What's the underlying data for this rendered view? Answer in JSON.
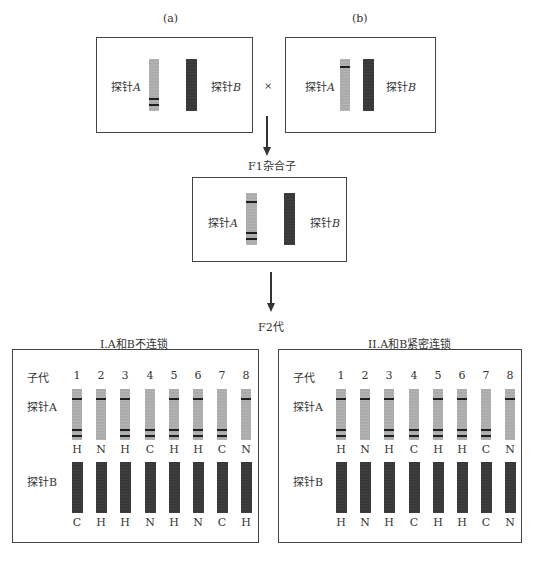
{
  "parents": {
    "a": {
      "label": "(a)",
      "probe_a": "探针",
      "probe_a_var": "A",
      "probe_b": "探针",
      "probe_b_var": "B"
    },
    "b": {
      "label": "(b)",
      "probe_a": "探针",
      "probe_a_var": "A",
      "probe_b": "探针",
      "probe_b_var": "B"
    },
    "cross_symbol": "×"
  },
  "f1": {
    "label": "F1杂合子",
    "probe_a": "探针",
    "probe_a_var": "A",
    "probe_b": "探针",
    "probe_b_var": "B"
  },
  "f2": {
    "label": "F2代"
  },
  "panels": [
    {
      "title": "I.A和B不连锁",
      "progeny_label": "子代",
      "probe_a_label": "探针A",
      "probe_b_label": "探针B",
      "progeny": [
        "1",
        "2",
        "3",
        "4",
        "5",
        "6",
        "7",
        "8"
      ],
      "probe_a_genotypes": [
        "H",
        "N",
        "H",
        "C",
        "H",
        "H",
        "C",
        "N"
      ],
      "probe_b_genotypes": [
        "C",
        "H",
        "H",
        "N",
        "H",
        "N",
        "C",
        "H"
      ]
    },
    {
      "title": "II.A和B紧密连锁",
      "progeny_label": "子代",
      "probe_a_label": "探针A",
      "probe_b_label": "探针B",
      "progeny": [
        "1",
        "2",
        "3",
        "4",
        "5",
        "6",
        "7",
        "8"
      ],
      "probe_a_genotypes": [
        "H",
        "N",
        "H",
        "C",
        "H",
        "H",
        "C",
        "N"
      ],
      "probe_b_genotypes": [
        "H",
        "N",
        "H",
        "C",
        "H",
        "H",
        "C",
        "N"
      ]
    }
  ]
}
